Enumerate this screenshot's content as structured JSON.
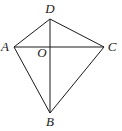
{
  "figure": {
    "type": "geometry-quadrilateral-with-diagonals",
    "points": {
      "A": {
        "label": "A",
        "x": 14,
        "y": 47,
        "lx": 5,
        "ly": 51
      },
      "B": {
        "label": "B",
        "x": 50,
        "y": 113,
        "lx": 50,
        "ly": 126
      },
      "C": {
        "label": "C",
        "x": 104,
        "y": 47,
        "lx": 112,
        "ly": 51
      },
      "D": {
        "label": "D",
        "x": 50,
        "y": 19,
        "lx": 50,
        "ly": 13
      },
      "O": {
        "label": "O",
        "x": 50,
        "y": 47,
        "lx": 42,
        "ly": 57
      }
    },
    "edges": [
      [
        "A",
        "D"
      ],
      [
        "D",
        "C"
      ],
      [
        "C",
        "B"
      ],
      [
        "B",
        "A"
      ],
      [
        "A",
        "C"
      ],
      [
        "D",
        "B"
      ]
    ],
    "stroke_color": "#1a1a1a"
  }
}
